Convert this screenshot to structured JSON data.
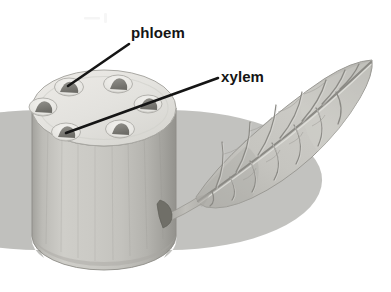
{
  "figure": {
    "background_color": "#ffffff",
    "style": "grayscale halftone textbook illustration"
  },
  "labels": [
    {
      "id": "phloem",
      "text": "phloem",
      "text_x": 131,
      "text_y": 38,
      "leader": {
        "x1": 129,
        "y1": 44,
        "x2": 68,
        "y2": 86
      },
      "color": "#151515"
    },
    {
      "id": "xylem",
      "text": "xylem",
      "text_x": 221,
      "text_y": 82,
      "leader": {
        "x1": 218,
        "y1": 78,
        "x2": 66,
        "y2": 133
      },
      "color": "#151515"
    }
  ],
  "stem": {
    "name": "cut-stem-cylinder",
    "top_face_color": "#e4e3df",
    "top_rim_color": "#b9b8b3",
    "body_light": "#cfcec9",
    "body_mid": "#bdbcb7",
    "body_dark": "#9d9c97",
    "outline_color": "#8e8d88",
    "center_x": 104,
    "top_center_y": 108,
    "radius_x": 72,
    "radius_y": 38,
    "bottom_center_y": 238
  },
  "vascular_bundles": [
    {
      "id": "bundle-1",
      "cx": 69,
      "cy": 87,
      "rx": 14,
      "ry": 9,
      "wedge": "upper-left"
    },
    {
      "id": "bundle-2",
      "cx": 118,
      "cy": 84,
      "rx": 14,
      "ry": 9,
      "wedge": "upper-right"
    },
    {
      "id": "bundle-3",
      "cx": 148,
      "cy": 104,
      "rx": 14,
      "ry": 9,
      "wedge": "right"
    },
    {
      "id": "bundle-4",
      "cx": 120,
      "cy": 128,
      "rx": 14,
      "ry": 9,
      "wedge": "lower-right"
    },
    {
      "id": "bundle-5",
      "cx": 66,
      "cy": 132,
      "rx": 14,
      "ry": 9,
      "wedge": "lower-left"
    },
    {
      "id": "bundle-6",
      "cx": 42,
      "cy": 106,
      "rx": 14,
      "ry": 9,
      "wedge": "left"
    }
  ],
  "bundle_colors": {
    "cavity_fill": "#f0efec",
    "cavity_shadow": "#b0afaa",
    "wedge_fill": "#8a8984",
    "wedge_dark": "#6f6e69"
  },
  "leaf": {
    "name": "leaf-blade",
    "fill_light": "#cdccc7",
    "fill_mid": "#bbbab5",
    "fill_dark": "#a5a49f",
    "vein_color": "#8b8a85",
    "vein_highlight": "#e2e1dd",
    "outline_color": "#9b9a95",
    "tip_x": 372,
    "tip_y": 62,
    "base_x": 186,
    "base_y": 203,
    "secondary_vein_pairs": 8
  },
  "petiole": {
    "name": "leaf-petiole",
    "fill": "#b4b3ae",
    "start_x": 160,
    "start_y": 214,
    "end_x": 200,
    "end_y": 196
  },
  "axillary_bud": {
    "name": "axillary-bud",
    "fill": "#77766f",
    "cx": 167,
    "cy": 212
  },
  "artifact": {
    "name": "scan-artifact",
    "x": 84,
    "y": 14,
    "color": "#eeeeee"
  }
}
